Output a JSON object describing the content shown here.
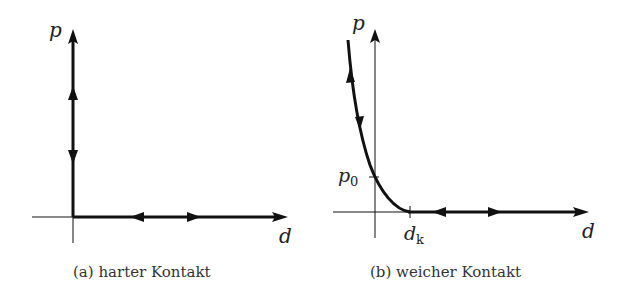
{
  "figure": {
    "panels": [
      {
        "id": "a",
        "caption": "(a) harter Kontakt",
        "x_axis_label": "d",
        "y_axis_label": "p",
        "description": "Hard contact: vertical thick line along p-axis at d=0 and thick horizontal line along d-axis for d>0, bidirectional arrows on both branches"
      },
      {
        "id": "b",
        "caption": "(b) weicher Kontakt",
        "x_axis_label": "d",
        "y_axis_label": "p",
        "tick_labels": {
          "p0": "p",
          "p0_sub": "0",
          "dk": "d",
          "dk_sub": "k"
        },
        "description": "Soft contact: exponential-like curve crossing p-axis at p0 and meeting d-axis at dk, then thick horizontal line along d-axis, bidirectional arrows"
      }
    ]
  }
}
